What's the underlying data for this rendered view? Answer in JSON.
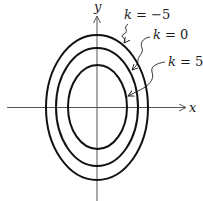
{
  "axes": {
    "x_label": "x",
    "y_label": "y"
  },
  "curves": [
    {
      "k_label": "k = −5",
      "k": -5
    },
    {
      "k_label": "k = 0",
      "k": 0
    },
    {
      "k_label": "k = 5",
      "k": 5
    }
  ],
  "colors": {
    "curve": "#111111",
    "axis": "#555555",
    "text": "#1a1a1a"
  }
}
